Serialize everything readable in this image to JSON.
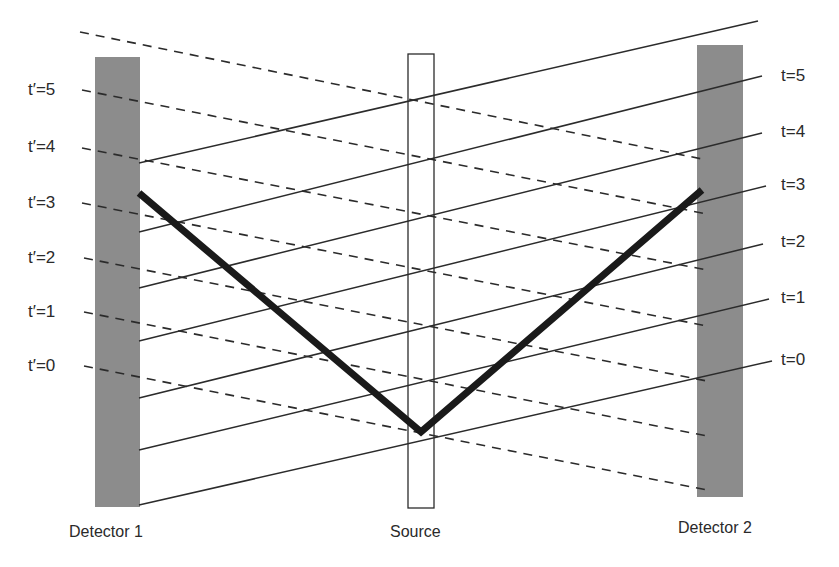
{
  "diagram": {
    "colors": {
      "detector_fill": "#8c8c8c",
      "line": "#2b2b2b",
      "thick_path": "#1a1a1a",
      "source_stroke": "#2b2b2b",
      "background": "#ffffff"
    },
    "captions": {
      "detector1": "Detector 1",
      "source": "Source",
      "detector2": "Detector 2"
    },
    "left_labels": [
      "t′=5",
      "t′=4",
      "t′=3",
      "t′=2",
      "t′=1",
      "t′=0"
    ],
    "right_labels": [
      "t=5",
      "t=4",
      "t=3",
      "t=2",
      "t=1",
      "t=0"
    ],
    "detectors": [
      {
        "name": "Detector 1",
        "x": 95,
        "y": 57,
        "w": 45,
        "h": 450
      },
      {
        "name": "Detector 2",
        "x": 697,
        "y": 45,
        "w": 46,
        "h": 452
      }
    ],
    "source_box": {
      "x": 408,
      "y": 54,
      "w": 26,
      "h": 454
    },
    "solid_lines": [
      {
        "x1": 139,
        "y1": 163,
        "x2": 758,
        "y2": 21
      },
      {
        "x1": 139,
        "y1": 232,
        "x2": 762,
        "y2": 76
      },
      {
        "x1": 139,
        "y1": 288,
        "x2": 762,
        "y2": 133
      },
      {
        "x1": 139,
        "y1": 341,
        "x2": 766,
        "y2": 186
      },
      {
        "x1": 139,
        "y1": 398,
        "x2": 763,
        "y2": 244
      },
      {
        "x1": 139,
        "y1": 450,
        "x2": 769,
        "y2": 299
      },
      {
        "x1": 139,
        "y1": 505,
        "x2": 772,
        "y2": 361
      }
    ],
    "dashed_lines": [
      {
        "x1": 80,
        "y1": 32,
        "x2": 707,
        "y2": 160
      },
      {
        "x1": 82,
        "y1": 90,
        "x2": 707,
        "y2": 214
      },
      {
        "x1": 82,
        "y1": 148,
        "x2": 707,
        "y2": 270
      },
      {
        "x1": 82,
        "y1": 203,
        "x2": 707,
        "y2": 326
      },
      {
        "x1": 84,
        "y1": 258,
        "x2": 707,
        "y2": 381
      },
      {
        "x1": 84,
        "y1": 312,
        "x2": 707,
        "y2": 436
      },
      {
        "x1": 84,
        "y1": 366,
        "x2": 707,
        "y2": 490
      }
    ],
    "thick_path": {
      "points": [
        [
          139,
          193
        ],
        [
          421,
          432
        ],
        [
          702,
          190
        ]
      ]
    }
  }
}
